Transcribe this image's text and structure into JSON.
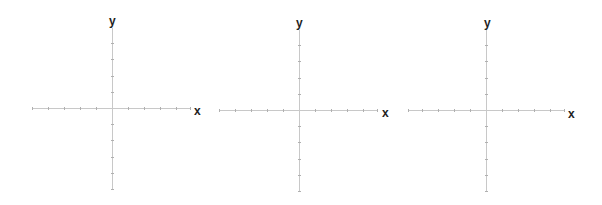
{
  "figure": {
    "axis_color": "#c8c8c8",
    "tick_color": "#b0b0b0",
    "label_color": "#222222",
    "planes": [
      {
        "x_label": "x",
        "y_label": "y",
        "ticks_per_side": 5,
        "tick_spacing_px": 16
      },
      {
        "x_label": "x",
        "y_label": "y",
        "ticks_per_side": 5,
        "tick_spacing_px": 16
      },
      {
        "x_label": "x",
        "y_label": "y",
        "ticks_per_side": 5,
        "tick_spacing_px": 16
      }
    ]
  }
}
